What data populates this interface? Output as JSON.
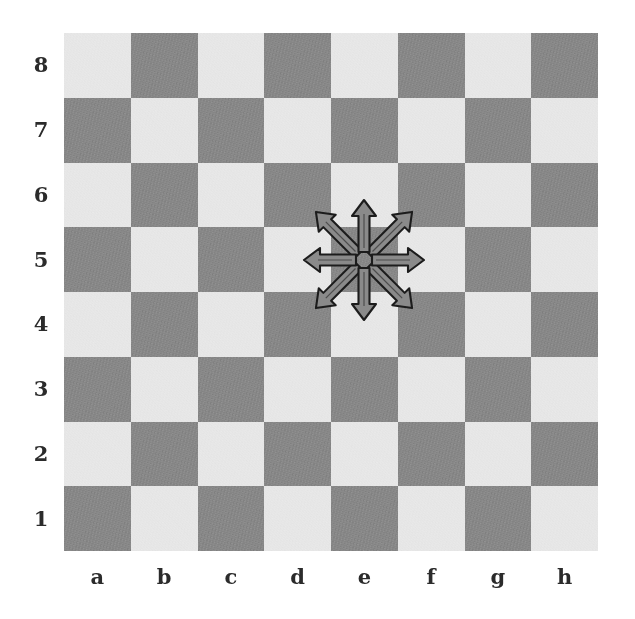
{
  "diagram": {
    "type": "chess-board",
    "board": {
      "files": [
        "a",
        "b",
        "c",
        "d",
        "e",
        "f",
        "g",
        "h"
      ],
      "ranks": [
        "8",
        "7",
        "6",
        "5",
        "4",
        "3",
        "2",
        "1"
      ],
      "size": 8,
      "orientation": "white-bottom",
      "light_square_color": "#e9e9e9",
      "dark_square_color": "#808080",
      "background_color": "#ffffff",
      "label_color": "#2b2b2b",
      "label_outline_color": "#ffffff",
      "square_colors": [
        [
          "light",
          "dark",
          "light",
          "dark",
          "light",
          "dark",
          "light",
          "dark"
        ],
        [
          "dark",
          "light",
          "dark",
          "light",
          "dark",
          "light",
          "dark",
          "light"
        ],
        [
          "light",
          "dark",
          "light",
          "dark",
          "light",
          "dark",
          "light",
          "dark"
        ],
        [
          "dark",
          "light",
          "dark",
          "light",
          "dark",
          "light",
          "dark",
          "light"
        ],
        [
          "light",
          "dark",
          "light",
          "dark",
          "light",
          "dark",
          "light",
          "dark"
        ],
        [
          "dark",
          "light",
          "dark",
          "light",
          "dark",
          "light",
          "dark",
          "light"
        ],
        [
          "light",
          "dark",
          "light",
          "dark",
          "light",
          "dark",
          "light",
          "dark"
        ],
        [
          "dark",
          "light",
          "dark",
          "light",
          "dark",
          "light",
          "dark",
          "light"
        ]
      ]
    },
    "annotation": {
      "name": "king-move-arrows",
      "origin_square": "e5",
      "arrow_count": 8,
      "arrow_fill": "#8a8a8a",
      "arrow_stroke": "#1c1c1c",
      "directions": [
        {
          "name": "north",
          "label": "e6",
          "kind": "orthogonal",
          "angle_deg": 90
        },
        {
          "name": "northeast",
          "label": "f6",
          "kind": "diagonal",
          "angle_deg": 45
        },
        {
          "name": "east",
          "label": "f5",
          "kind": "orthogonal",
          "angle_deg": 0
        },
        {
          "name": "southeast",
          "label": "f4",
          "kind": "diagonal",
          "angle_deg": 315
        },
        {
          "name": "south",
          "label": "e4",
          "kind": "orthogonal",
          "angle_deg": 270
        },
        {
          "name": "southwest",
          "label": "d4",
          "kind": "diagonal",
          "angle_deg": 225
        },
        {
          "name": "west",
          "label": "d5",
          "kind": "orthogonal",
          "angle_deg": 180
        },
        {
          "name": "northwest",
          "label": "d6",
          "kind": "diagonal",
          "angle_deg": 135
        }
      ]
    }
  }
}
